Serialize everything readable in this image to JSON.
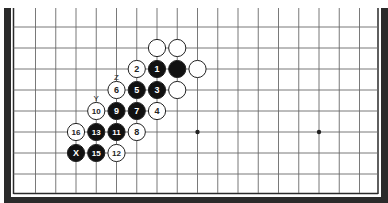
{
  "diagram": {
    "type": "board-game-diagram",
    "colors": {
      "frame": "#2a2a2a",
      "grid": "#6a6a6a",
      "black_stone": "#111111",
      "white_stone": "#ffffff",
      "stone_outline": "#222222",
      "background": "#ffffff"
    },
    "grid": {
      "x0": 35.5,
      "dx": 20.25,
      "cols": 17,
      "y0": 27,
      "dy": 21,
      "rows": 8
    },
    "star_points": [
      {
        "col": 8,
        "row": 5
      },
      {
        "col": 14,
        "row": 5
      }
    ],
    "stones": [
      {
        "color": "white",
        "col": 6,
        "row": 1,
        "label": ""
      },
      {
        "color": "white",
        "col": 7,
        "row": 1,
        "label": ""
      },
      {
        "color": "white",
        "col": 5,
        "row": 2,
        "label": "2"
      },
      {
        "color": "black",
        "col": 6,
        "row": 2,
        "label": "1"
      },
      {
        "color": "black",
        "col": 7,
        "row": 2,
        "label": ""
      },
      {
        "color": "white",
        "col": 8,
        "row": 2,
        "label": ""
      },
      {
        "color": "white",
        "col": 4,
        "row": 3,
        "label": "6"
      },
      {
        "color": "black",
        "col": 5,
        "row": 3,
        "label": "5"
      },
      {
        "color": "black",
        "col": 6,
        "row": 3,
        "label": "3"
      },
      {
        "color": "white",
        "col": 7,
        "row": 3,
        "label": ""
      },
      {
        "color": "white",
        "col": 3,
        "row": 4,
        "label": "10"
      },
      {
        "color": "black",
        "col": 4,
        "row": 4,
        "label": "9"
      },
      {
        "color": "black",
        "col": 5,
        "row": 4,
        "label": "7"
      },
      {
        "color": "white",
        "col": 6,
        "row": 4,
        "label": "4"
      },
      {
        "color": "white",
        "col": 2,
        "row": 5,
        "label": "16"
      },
      {
        "color": "black",
        "col": 3,
        "row": 5,
        "label": "13"
      },
      {
        "color": "black",
        "col": 4,
        "row": 5,
        "label": "11"
      },
      {
        "color": "white",
        "col": 5,
        "row": 5,
        "label": "8"
      },
      {
        "color": "black",
        "col": 2,
        "row": 6,
        "label": "X"
      },
      {
        "color": "black",
        "col": 3,
        "row": 6,
        "label": "15"
      },
      {
        "color": "white",
        "col": 4,
        "row": 6,
        "label": "12"
      }
    ],
    "point_labels": [
      {
        "text": "Z",
        "col": 4,
        "row": 2.4
      },
      {
        "text": "Y",
        "col": 3,
        "row": 3.4
      }
    ]
  }
}
